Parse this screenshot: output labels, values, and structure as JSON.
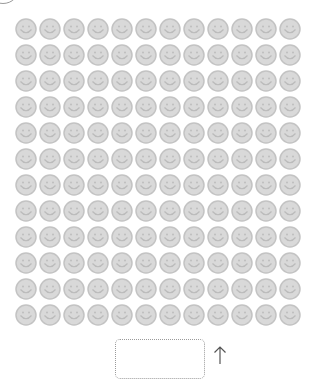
{
  "grid": {
    "rows": 12,
    "columns": 12,
    "item_icon": "smiley-face-icon",
    "colors": {
      "fill": "#d9d9d9",
      "stroke": "#c3c3c3",
      "features": "#bbbbbb"
    }
  },
  "drop_box": {
    "label": ""
  },
  "arrow": {
    "icon": "arrow-up-icon",
    "glyph": "↑"
  }
}
